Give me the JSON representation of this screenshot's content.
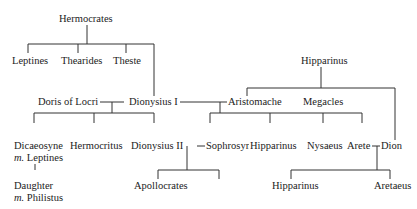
{
  "nodes": {
    "hermocrates": "Hermocrates",
    "leptines": "Leptines",
    "thearides": "Thearides",
    "theste": "Theste",
    "hipparinus_elder": "Hipparinus",
    "doris": "Doris of Locri",
    "dionysius1": "Dionysius I",
    "aristomache": "Aristomache",
    "megacles": "Megacles",
    "dicaeosyne": "Dicaeosyne",
    "dicaeosyne_spouse_prefix": "m.",
    "dicaeosyne_spouse": "Leptines",
    "hermocritus": "Hermocritus",
    "dionysius2": "Dionysius II",
    "sophrosyne": "Sophrosyne",
    "hipparinus_son": "Hipparinus",
    "nysaeus": "Nysaeus",
    "arete": "Arete",
    "dion": "Dion",
    "daughter": "Daughter",
    "daughter_spouse_prefix": "m.",
    "daughter_spouse": "Philistus",
    "apollocrates": "Apollocrates",
    "hipparinus_grandson": "Hipparinus",
    "aretaeus": "Aretaeus"
  }
}
